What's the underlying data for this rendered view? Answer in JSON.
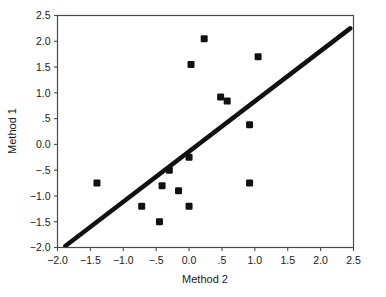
{
  "chart_data": {
    "type": "scatter",
    "title": "",
    "xlabel": "Method 2",
    "ylabel": "Method 1",
    "xlim": [
      -2.0,
      2.5
    ],
    "ylim": [
      -2.0,
      2.5
    ],
    "xticks": [
      -2.0,
      -1.5,
      -1.0,
      -0.5,
      0.0,
      0.5,
      1.0,
      1.5,
      2.0,
      2.5
    ],
    "yticks": [
      -2.0,
      -1.5,
      -1.0,
      -0.5,
      0.0,
      0.5,
      1.0,
      1.5,
      2.0,
      2.5
    ],
    "xtick_labels": [
      "-2.0",
      "-1.5",
      "-1.0",
      "-.5",
      "0.0",
      ".5",
      "1.0",
      "1.5",
      "2.0",
      "2.5"
    ],
    "ytick_labels": [
      "-2.0",
      "-1.5",
      "-1.0",
      "-.5",
      "0.0",
      ".5",
      "1.0",
      "1.5",
      "2.0",
      "2.5"
    ],
    "grid": false,
    "legend": null,
    "marker": "square",
    "marker_color": "#111111",
    "marker_size": 7,
    "points": [
      {
        "x": -1.4,
        "y": -0.75
      },
      {
        "x": -0.72,
        "y": -1.2
      },
      {
        "x": -0.45,
        "y": -1.5
      },
      {
        "x": -0.41,
        "y": -0.8
      },
      {
        "x": -0.3,
        "y": -0.5
      },
      {
        "x": -0.16,
        "y": -0.9
      },
      {
        "x": 0.0,
        "y": -0.25
      },
      {
        "x": 0.0,
        "y": -1.2
      },
      {
        "x": 0.03,
        "y": 1.55
      },
      {
        "x": 0.23,
        "y": 2.05
      },
      {
        "x": 0.48,
        "y": 0.92
      },
      {
        "x": 0.58,
        "y": 0.84
      },
      {
        "x": 0.92,
        "y": 0.38
      },
      {
        "x": 0.92,
        "y": -0.75
      },
      {
        "x": 1.05,
        "y": 1.7
      }
    ],
    "fit_line": {
      "label": "regression line",
      "x0": -1.88,
      "y0": -1.97,
      "x1": 2.45,
      "y1": 2.25,
      "color": "#111111",
      "width": 4.5
    },
    "frame": {
      "color": "#4a4a4a",
      "width": 1.2
    }
  }
}
